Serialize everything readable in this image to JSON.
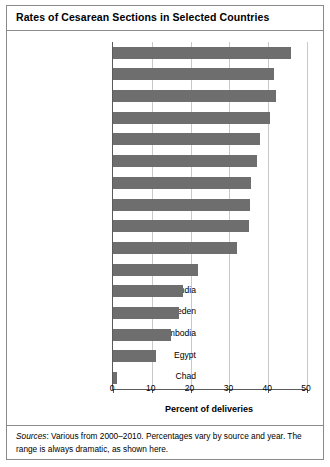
{
  "chart_data": {
    "type": "bar",
    "orientation": "horizontal",
    "title": "Rates of Cesarean Sections in Selected Countries",
    "xlabel": "Percent of deliveries",
    "ylabel": "",
    "xlim": [
      0,
      50
    ],
    "xticks": [
      0,
      10,
      20,
      30,
      40,
      50
    ],
    "xtick_labels": [
      "0",
      "10",
      "20",
      "30",
      "40",
      "50"
    ],
    "grid": "vertical",
    "legend": "none",
    "bar_color": "#6e6e6e",
    "categories": [
      "China",
      "Dominican Republic",
      "Paraguay",
      "Chile",
      "Italy",
      "Mexico",
      "Turkey",
      "Vietnam",
      "Nigeria",
      "United States",
      "Costa Rica",
      "India",
      "Sweden",
      "Cambodia",
      "Egypt",
      "Chad"
    ],
    "values": [
      46,
      41.5,
      42,
      40.5,
      38,
      37,
      35.5,
      35.3,
      35,
      32,
      22,
      18,
      17,
      15,
      11,
      1
    ]
  },
  "figure": {
    "title": "Rates of Cesarean Sections in Selected Countries",
    "source_label": "Sources",
    "source_text": ": Various from 2000–2010. Percentages vary by source and year. The range is always dramatic, as shown here."
  }
}
